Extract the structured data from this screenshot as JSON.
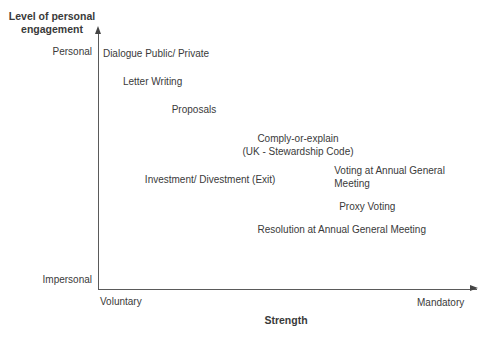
{
  "figure": {
    "background": "#ffffff",
    "text_color": "#3a3a3a",
    "axis_color": "#5a5a5a"
  },
  "chart_data": {
    "type": "scatter",
    "title": "",
    "xlabel": "Strength",
    "ylabel": "Level of personal engagement",
    "x_axis": {
      "type": "qualitative",
      "min_label": "Voluntary",
      "max_label": "Mandatory",
      "range": [
        0,
        1
      ]
    },
    "y_axis": {
      "type": "qualitative",
      "min_label": "Impersonal",
      "max_label": "Personal",
      "range": [
        0,
        1
      ]
    },
    "grid": false,
    "legend": false,
    "points": [
      {
        "label": "Dialogue Public/ Private",
        "x": 0.013,
        "y": 0.923,
        "align": "left"
      },
      {
        "label": "Letter Writing",
        "x": 0.066,
        "y": 0.811,
        "align": "left"
      },
      {
        "label": "Proposals",
        "x": 0.195,
        "y": 0.703,
        "align": "left"
      },
      {
        "label": "Comply-or-explain\n(UK - Stewardship Code)",
        "x": 0.529,
        "y": 0.563,
        "align": "center"
      },
      {
        "label": "Investment/ Divestment (Exit)",
        "x": 0.124,
        "y": 0.431,
        "align": "left"
      },
      {
        "label": "Voting at Annual General Meeting",
        "x": 0.625,
        "y": 0.439,
        "align": "left"
      },
      {
        "label": "Proxy Voting",
        "x": 0.638,
        "y": 0.325,
        "align": "left"
      },
      {
        "label": "Resolution at Annual General Meeting",
        "x": 0.422,
        "y": 0.234,
        "align": "left"
      }
    ]
  },
  "axes_labels": {
    "y_title": "Level of personal engagement",
    "y_max": "Personal",
    "y_min": "Impersonal",
    "x_min": "Voluntary",
    "x_max": "Mandatory",
    "x_title": "Strength"
  }
}
